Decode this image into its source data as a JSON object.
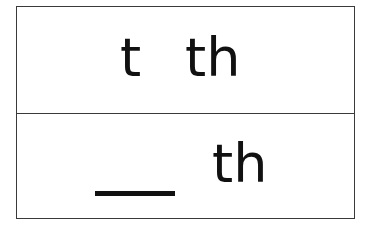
{
  "card": {
    "top_row": {
      "left_word": "t",
      "right_word": "th"
    },
    "bottom_row": {
      "blank": "___",
      "word": "th"
    }
  },
  "colors": {
    "text": "#111111",
    "border": "#3a3a3a",
    "background": "#ffffff"
  }
}
